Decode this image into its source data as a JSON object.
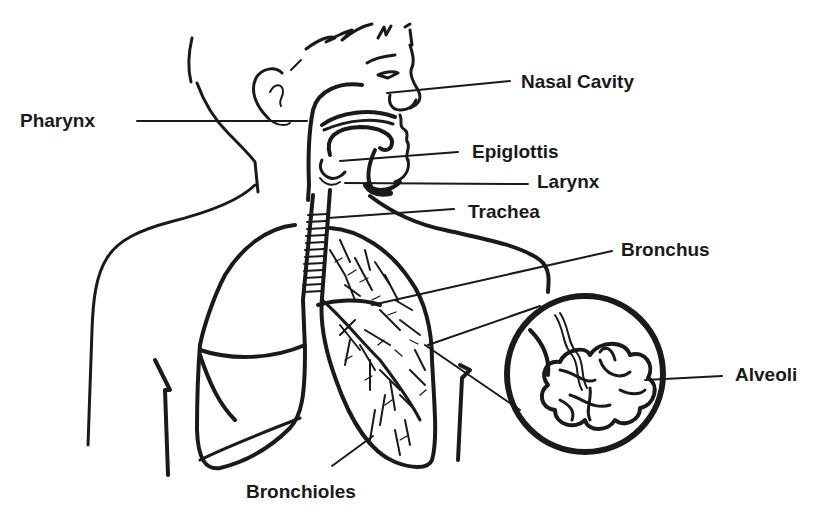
{
  "diagram": {
    "colors": {
      "ink": "#1a1a1a",
      "background": "#ffffff"
    },
    "labels": {
      "pharynx": "Pharynx",
      "nasal_cavity": "Nasal Cavity",
      "epiglottis": "Epiglottis",
      "larynx": "Larynx",
      "trachea": "Trachea",
      "bronchus": "Bronchus",
      "alveoli": "Alveoli",
      "bronchioles": "Bronchioles"
    }
  }
}
